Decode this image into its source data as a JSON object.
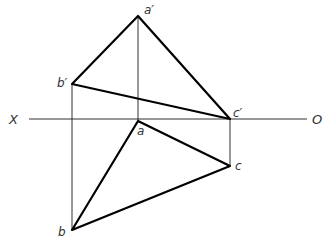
{
  "diagram": {
    "type": "orthographic-projection",
    "axis": {
      "left_label": "X",
      "right_label": "O",
      "y": 119,
      "x1": 29,
      "x2": 307
    },
    "points": {
      "a_prime": {
        "label": "a′",
        "x": 138,
        "y": 16
      },
      "b_prime": {
        "label": "b′",
        "x": 72,
        "y": 84
      },
      "c_prime": {
        "label": "c′",
        "x": 230,
        "y": 119
      },
      "a": {
        "label": "a",
        "x": 138,
        "y": 120
      },
      "b": {
        "label": "b",
        "x": 72,
        "y": 230
      },
      "c": {
        "label": "c",
        "x": 230,
        "y": 166
      }
    },
    "front_view_triangle": [
      "a′",
      "b′",
      "c′"
    ],
    "top_view_triangle": [
      "a",
      "b",
      "c"
    ],
    "projection_lines": [
      [
        "a′",
        "a"
      ],
      [
        "b′",
        "b"
      ],
      [
        "c′",
        "c"
      ]
    ],
    "colors": {
      "line": "#000000",
      "label": "#333333",
      "background": "#ffffff"
    }
  }
}
